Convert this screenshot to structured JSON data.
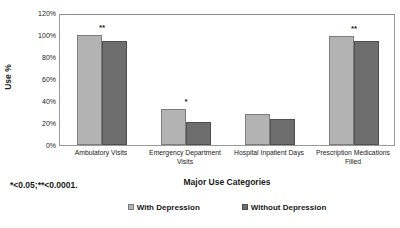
{
  "chart_data": {
    "type": "bar",
    "title": "",
    "xlabel": "Major Use Categories",
    "ylabel": "Use %",
    "ylim": [
      0,
      120
    ],
    "ytick_labels": [
      "120%",
      "100%",
      "80%",
      "60%",
      "40%",
      "20%",
      "0%"
    ],
    "ytick_values": [
      120,
      100,
      80,
      60,
      40,
      20,
      0
    ],
    "grid": false,
    "legend_position": "bottom",
    "categories": [
      "Ambulatory Visits",
      "Emergency Department Visits",
      "Hospital Inpatient Days",
      "Prescription Medications Filled"
    ],
    "category_lines": [
      [
        "Ambulatory Visits"
      ],
      [
        "Emergency Department",
        "Visits"
      ],
      [
        "Hospital Inpatient Days"
      ],
      [
        "Prescription Medications",
        "Filled"
      ]
    ],
    "series": [
      {
        "name": "With Depression",
        "color": "#b3b3b3",
        "values": [
          100,
          33,
          28,
          99
        ]
      },
      {
        "name": "Without Depression",
        "color": "#6e6e6e",
        "values": [
          95,
          21,
          24,
          95
        ]
      }
    ],
    "annotations": [
      {
        "category": "Ambulatory Visits",
        "text": "**"
      },
      {
        "category": "Emergency Department Visits",
        "text": "*"
      },
      {
        "category": "Hospital Inpatient Days",
        "text": ""
      },
      {
        "category": "Prescription Medications Filled",
        "text": "**"
      }
    ],
    "footnote": "*<0.05;**<0.0001."
  },
  "legend": {
    "items": [
      {
        "label": "With Depression",
        "swatch": "legend-swatch-with-depression"
      },
      {
        "label": "Without Depression",
        "swatch": "legend-swatch-without-depression"
      }
    ]
  },
  "axes": {
    "y_label": "Use %",
    "x_title": "Major Use Categories"
  }
}
